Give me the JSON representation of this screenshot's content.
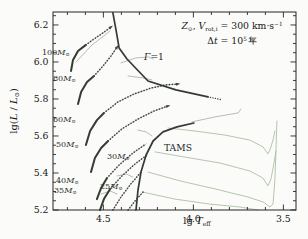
{
  "figure": {
    "kind": "Hertzsprung-Russell diagram with stellar evolutionary tracks",
    "background": "#fbfbf9"
  },
  "chart_data": {
    "type": "line",
    "title": "",
    "xlabel_parts": [
      {
        "t": "lg "
      },
      {
        "t": "T",
        "it": true
      },
      {
        "t": "eff",
        "sub": true
      }
    ],
    "ylabel_parts": [
      {
        "t": "lg("
      },
      {
        "t": "L",
        "it": true
      },
      {
        "t": " / "
      },
      {
        "t": "L",
        "it": true
      },
      {
        "t": "⊙",
        "sub": true
      },
      {
        "t": ")"
      }
    ],
    "x_axis": {
      "min": 3.43,
      "max": 4.78,
      "reversed": true,
      "major_ticks": [
        4.5,
        4.0,
        3.5
      ],
      "tick_labels": [
        "4.5",
        "4.0",
        "3.5"
      ],
      "minor_step": 0.1
    },
    "y_axis": {
      "min": 5.2,
      "max": 6.27,
      "major_ticks": [
        6.2,
        6.0,
        5.8,
        5.6,
        5.4,
        5.2
      ],
      "tick_labels": [
        "6.2",
        "6.0",
        "5.8",
        "5.6",
        "5.4",
        "5.2"
      ],
      "minor_step": 0.05
    },
    "grid": false,
    "layout": {
      "plot_px": {
        "l": 53,
        "t": 12,
        "r": 296,
        "b": 210
      },
      "tick_len_major": 5.5,
      "tick_len_minor": 3
    },
    "annotation_lines": [
      {
        "name": "annotation-line1",
        "parts": [
          {
            "t": "Z",
            "it": true
          },
          {
            "t": "⊙",
            "sub": true
          },
          {
            "t": ", "
          },
          {
            "t": "V",
            "it": true
          },
          {
            "t": "rot,i",
            "sub": true
          },
          {
            "t": " = 300 km·s"
          },
          {
            "t": "−1",
            "sup": true
          }
        ]
      },
      {
        "name": "annotation-line2",
        "parts": [
          {
            "t": "Δ"
          },
          {
            "t": "t",
            "it": true
          },
          {
            "t": " = 10"
          },
          {
            "t": "5",
            "sup": true
          },
          {
            "t": "年",
            "cjk": true
          }
        ]
      }
    ],
    "labels": [
      {
        "name": "label-mass-100",
        "x": 42,
        "y": 49,
        "parts": [
          {
            "t": "100"
          },
          {
            "t": "M",
            "it": true
          },
          {
            "t": "⊙",
            "sub": true
          }
        ]
      },
      {
        "name": "label-mass-80",
        "x": 53,
        "y": 75,
        "parts": [
          {
            "t": "80"
          },
          {
            "t": "M",
            "it": true
          },
          {
            "t": "⊙",
            "sub": true
          }
        ]
      },
      {
        "name": "label-mass-60",
        "x": 53,
        "y": 116,
        "parts": [
          {
            "t": "60"
          },
          {
            "t": "M",
            "it": true
          },
          {
            "t": "⊙",
            "sub": true
          }
        ]
      },
      {
        "name": "label-mass-50",
        "x": 56,
        "y": 141,
        "parts": [
          {
            "t": "50"
          },
          {
            "t": "M",
            "it": true
          },
          {
            "t": "⊙",
            "sub": true
          }
        ]
      },
      {
        "name": "label-mass-40",
        "x": 56,
        "y": 177,
        "parts": [
          {
            "t": "40"
          },
          {
            "t": "M",
            "it": true
          },
          {
            "t": "⊙",
            "sub": true
          }
        ]
      },
      {
        "name": "label-mass-35",
        "x": 54,
        "y": 187,
        "parts": [
          {
            "t": "35"
          },
          {
            "t": "M",
            "it": true
          },
          {
            "t": "⊙",
            "sub": true
          }
        ]
      },
      {
        "name": "label-mass-30",
        "x": 107,
        "y": 153,
        "parts": [
          {
            "t": "30"
          },
          {
            "t": "M",
            "it": true
          },
          {
            "t": "⊙",
            "sub": true
          }
        ]
      },
      {
        "name": "label-mass-25",
        "x": 100,
        "y": 183,
        "parts": [
          {
            "t": "25"
          },
          {
            "t": "M",
            "it": true
          },
          {
            "t": "⊙",
            "sub": true
          }
        ]
      },
      {
        "name": "label-gamma-limit",
        "x": 144,
        "y": 52,
        "big": true,
        "parts": [
          {
            "t": "Γ",
            "it": true
          },
          {
            "t": "=1"
          }
        ]
      },
      {
        "name": "label-tams",
        "x": 164,
        "y": 143,
        "big": true,
        "parts": [
          {
            "t": "TAMS"
          }
        ]
      }
    ],
    "styles": {
      "thick": {
        "color": "#343c32",
        "width": 2
      },
      "ms": {
        "color": "#979f95",
        "width": 0.7,
        "overlay": {
          "color": "#3f463d",
          "width": 1.6,
          "dash": "0.1 2.8"
        }
      },
      "boundary": {
        "color": "#343c32",
        "width": 1.7
      },
      "dots_tail": {
        "color": "#3f463d",
        "width": 1.4,
        "dash": "0.1 2.4"
      },
      "rsg": {
        "color": "#adc0a5",
        "width": 0.9
      },
      "spur": {
        "color": "#9aa298",
        "width": 0.7
      }
    },
    "arrow_color": "#3f463d",
    "series": [
      {
        "name": "rsg-branch-1",
        "style": "rsg",
        "pts": [
          [
            4.141,
            5.643
          ],
          [
            3.991,
            5.627
          ],
          [
            3.824,
            5.605
          ],
          [
            3.686,
            5.578
          ],
          [
            3.613,
            5.541
          ],
          [
            3.586,
            5.503
          ],
          [
            3.575,
            5.524
          ],
          [
            3.558,
            5.578
          ],
          [
            3.547,
            5.627
          ]
        ]
      },
      {
        "name": "rsg-branch-2",
        "style": "rsg",
        "pts": [
          [
            4.213,
            5.514
          ],
          [
            4.047,
            5.486
          ],
          [
            3.852,
            5.454
          ],
          [
            3.686,
            5.411
          ],
          [
            3.614,
            5.373
          ],
          [
            3.586,
            5.33
          ],
          [
            3.569,
            5.368
          ],
          [
            3.552,
            5.454
          ],
          [
            3.541,
            5.519
          ]
        ]
      },
      {
        "name": "rsg-branch-3",
        "style": "rsg",
        "pts": [
          [
            4.252,
            5.405
          ],
          [
            4.074,
            5.357
          ],
          [
            3.88,
            5.314
          ],
          [
            3.697,
            5.27
          ],
          [
            3.613,
            5.243
          ],
          [
            3.575,
            5.216
          ],
          [
            3.558,
            5.232
          ],
          [
            3.547,
            5.362
          ],
          [
            3.541,
            5.524
          ],
          [
            3.536,
            5.681
          ]
        ]
      },
      {
        "name": "rsg-branch-4",
        "style": "rsg",
        "pts": [
          [
            4.28,
            5.297
          ],
          [
            4.102,
            5.259
          ],
          [
            3.908,
            5.232
          ],
          [
            3.741,
            5.216
          ],
          [
            3.641,
            5.2
          ]
        ]
      },
      {
        "name": "track-60-post",
        "style": "spur",
        "pts": [
          [
            4.008,
            5.676
          ],
          [
            3.88,
            5.703
          ],
          [
            3.752,
            5.724
          ],
          [
            3.736,
            5.746
          ]
        ]
      },
      {
        "name": "spur-100",
        "style": "spur",
        "pts": [
          [
            4.652,
            6.0
          ],
          [
            4.563,
            6.092
          ],
          [
            4.497,
            6.141
          ],
          [
            4.463,
            6.168
          ]
        ]
      },
      {
        "name": "spur-80a",
        "style": "spur",
        "pts": [
          [
            4.402,
            5.995
          ],
          [
            4.319,
            6.022
          ],
          [
            4.247,
            6.027
          ],
          [
            4.224,
            6.016
          ]
        ]
      },
      {
        "name": "spur-80b",
        "style": "spur",
        "pts": [
          [
            4.363,
            5.924
          ],
          [
            4.28,
            5.914
          ],
          [
            4.23,
            5.903
          ]
        ]
      },
      {
        "name": "spur-40",
        "style": "spur",
        "pts": [
          [
            4.308,
            5.632
          ],
          [
            4.263,
            5.622
          ],
          [
            4.23,
            5.6
          ]
        ]
      },
      {
        "name": "spur-30",
        "style": "spur",
        "pts": [
          [
            4.424,
            5.384
          ],
          [
            4.374,
            5.395
          ],
          [
            4.336,
            5.378
          ]
        ]
      },
      {
        "name": "spur-25",
        "style": "spur",
        "pts": [
          [
            4.513,
            5.286
          ],
          [
            4.463,
            5.303
          ],
          [
            4.424,
            5.286
          ]
        ]
      },
      {
        "name": "track-100-zams",
        "style": "thick",
        "pts": [
          [
            4.68,
            5.951
          ],
          [
            4.669,
            6.011
          ],
          [
            4.641,
            6.059
          ],
          [
            4.597,
            6.092
          ]
        ]
      },
      {
        "name": "track-100-ms",
        "style": "ms",
        "arrow": true,
        "pts": [
          [
            4.597,
            6.092
          ],
          [
            4.552,
            6.124
          ],
          [
            4.502,
            6.157
          ],
          [
            4.458,
            6.189
          ]
        ]
      },
      {
        "name": "track-80-zams",
        "style": "thick",
        "pts": [
          [
            4.641,
            5.773
          ],
          [
            4.624,
            5.838
          ],
          [
            4.591,
            5.892
          ],
          [
            4.552,
            5.924
          ]
        ]
      },
      {
        "name": "track-80-ms",
        "style": "ms",
        "arrow": true,
        "pts": [
          [
            4.552,
            5.924
          ],
          [
            4.502,
            5.978
          ],
          [
            4.458,
            6.032
          ],
          [
            4.424,
            6.081
          ]
        ]
      },
      {
        "name": "track-60-zams",
        "style": "thick",
        "pts": [
          [
            4.597,
            5.551
          ],
          [
            4.574,
            5.627
          ],
          [
            4.536,
            5.686
          ],
          [
            4.497,
            5.724
          ]
        ]
      },
      {
        "name": "track-60-ms",
        "style": "ms",
        "arrow": true,
        "pts": [
          [
            4.497,
            5.724
          ],
          [
            4.419,
            5.784
          ],
          [
            4.33,
            5.827
          ],
          [
            4.236,
            5.859
          ],
          [
            4.152,
            5.876
          ],
          [
            4.086,
            5.881
          ]
        ]
      },
      {
        "name": "track-50-zams",
        "style": "thick",
        "pts": [
          [
            4.569,
            5.405
          ],
          [
            4.547,
            5.481
          ],
          [
            4.513,
            5.535
          ],
          [
            4.474,
            5.573
          ]
        ]
      },
      {
        "name": "track-50-ms",
        "style": "ms",
        "arrow": true,
        "pts": [
          [
            4.474,
            5.573
          ],
          [
            4.397,
            5.638
          ],
          [
            4.308,
            5.692
          ],
          [
            4.219,
            5.735
          ],
          [
            4.141,
            5.762
          ]
        ]
      },
      {
        "name": "track-40-zams",
        "style": "thick",
        "pts": [
          [
            4.536,
            5.259
          ],
          [
            4.513,
            5.319
          ],
          [
            4.48,
            5.373
          ]
        ]
      },
      {
        "name": "track-40-ms",
        "style": "ms",
        "pts": [
          [
            4.48,
            5.373
          ],
          [
            4.413,
            5.443
          ],
          [
            4.336,
            5.508
          ],
          [
            4.263,
            5.557
          ]
        ]
      },
      {
        "name": "track-35-zams",
        "style": "thick",
        "pts": [
          [
            4.519,
            5.2
          ],
          [
            4.497,
            5.259
          ],
          [
            4.463,
            5.314
          ]
        ]
      },
      {
        "name": "track-35-ms",
        "style": "ms",
        "pts": [
          [
            4.463,
            5.314
          ],
          [
            4.397,
            5.384
          ],
          [
            4.324,
            5.449
          ],
          [
            4.258,
            5.497
          ]
        ]
      },
      {
        "name": "track-30-ms",
        "style": "ms",
        "pts": [
          [
            4.447,
            5.2
          ],
          [
            4.402,
            5.27
          ],
          [
            4.347,
            5.341
          ],
          [
            4.291,
            5.405
          ]
        ]
      },
      {
        "name": "track-25-ms",
        "style": "ms",
        "pts": [
          [
            4.363,
            5.2
          ],
          [
            4.324,
            5.249
          ],
          [
            4.28,
            5.297
          ]
        ]
      },
      {
        "name": "tams-line",
        "style": "boundary",
        "pts": [
          [
            4.319,
            5.2
          ],
          [
            4.308,
            5.308
          ],
          [
            4.291,
            5.405
          ],
          [
            4.263,
            5.497
          ],
          [
            4.224,
            5.573
          ],
          [
            4.169,
            5.622
          ],
          [
            4.091,
            5.649
          ],
          [
            3.997,
            5.67
          ]
        ]
      },
      {
        "name": "gamma-limit-line",
        "style": "boundary",
        "pts": [
          [
            4.447,
            6.265
          ],
          [
            4.43,
            6.173
          ],
          [
            4.413,
            6.076
          ],
          [
            4.369,
            6.016
          ],
          [
            4.252,
            5.897
          ],
          [
            4.097,
            5.849
          ],
          [
            3.919,
            5.811
          ]
        ]
      },
      {
        "name": "gamma-limit-dotted",
        "style": "dots_tail",
        "pts": [
          [
            3.919,
            5.811
          ],
          [
            3.878,
            5.803
          ],
          [
            3.841,
            5.795
          ]
        ]
      }
    ]
  }
}
